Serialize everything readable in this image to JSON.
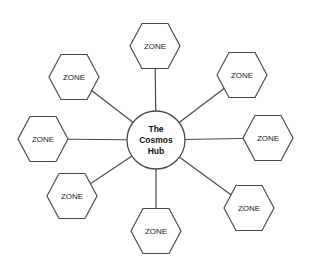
{
  "hub": {
    "label_lines": [
      "The",
      "Cosmos",
      "Hub"
    ],
    "cx": 156,
    "cy": 140,
    "r": 29
  },
  "zones": [
    {
      "id": "top",
      "label": "ZONE",
      "cx": 155,
      "cy": 46
    },
    {
      "id": "upper-right",
      "label": "ZONE",
      "cx": 242,
      "cy": 75
    },
    {
      "id": "right",
      "label": "ZONE",
      "cx": 268,
      "cy": 138
    },
    {
      "id": "lower-right",
      "label": "ZONE",
      "cx": 249,
      "cy": 208
    },
    {
      "id": "bottom",
      "label": "ZONE",
      "cx": 156,
      "cy": 231
    },
    {
      "id": "lower-left",
      "label": "ZONE",
      "cx": 72,
      "cy": 196
    },
    {
      "id": "left",
      "label": "ZONE",
      "cx": 43,
      "cy": 139
    },
    {
      "id": "upper-left",
      "label": "ZONE",
      "cx": 74,
      "cy": 77
    }
  ],
  "colors": {
    "stroke": "#4a4a4a",
    "fill": "#ffffff",
    "text": "#222222"
  }
}
